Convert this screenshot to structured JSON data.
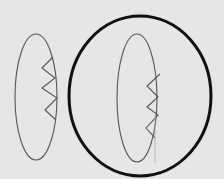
{
  "diagram": {
    "background": "#e6e6e4",
    "stroke_thin": "#555555",
    "stroke_bold": "#111111",
    "left_ellipse": {
      "cx": 36,
      "cy": 97,
      "rx": 21,
      "ry": 63,
      "zigzag": "53,57 42,68 55,78 42,88 57,98 45,110 56,120"
    },
    "big_circle": {
      "cx": 140,
      "cy": 96,
      "rx": 71,
      "ry": 80
    },
    "inner_ellipse": {
      "cx": 137,
      "cy": 98,
      "rx": 20,
      "ry": 64,
      "zigzag": "160,74 147,86 158,97 147,107 158,115 146,128 155,138"
    },
    "faint_line": {
      "x1": 155,
      "y1": 115,
      "x2": 155,
      "y2": 163
    }
  }
}
